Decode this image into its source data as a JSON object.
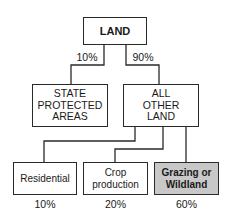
{
  "diagram": {
    "root": {
      "label": "LAND"
    },
    "level1": [
      {
        "label": "STATE\nPROTECTED\nAREAS",
        "share": "10%"
      },
      {
        "label": "ALL\nOTHER\nLAND",
        "share": "90%"
      }
    ],
    "level2": [
      {
        "label": "Residential",
        "share": "10%"
      },
      {
        "label": "Crop\nproduction",
        "share": "20%"
      },
      {
        "label": "Grazing or\nWildland",
        "share": "60%",
        "highlighted": true
      }
    ],
    "colors": {
      "line": "#2a2a2a",
      "highlight_fill": "#c8c8c8",
      "box_fill": "#ffffff"
    }
  }
}
